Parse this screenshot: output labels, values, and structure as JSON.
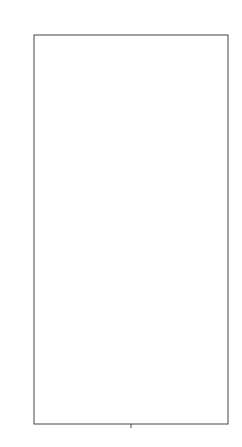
{
  "chart_data": {
    "type": "boxplot",
    "title": "",
    "xlabel": "",
    "ylabel": "",
    "categories": [
      "会员年龄"
    ],
    "ylim": [
      0,
      116
    ],
    "yticks": [
      20,
      40,
      60,
      80,
      100
    ],
    "grid": true,
    "legend": null,
    "series": [
      {
        "name": "会员年龄",
        "q1": 35,
        "median": 41,
        "q3": 48,
        "whisker_low": 16,
        "whisker_high": 67,
        "outliers_high": [
          68,
          69,
          70,
          71,
          72,
          73,
          74,
          75,
          76,
          77,
          78,
          79,
          80,
          81,
          82,
          83,
          84,
          85,
          86,
          87,
          88,
          89,
          90,
          91,
          92,
          110
        ],
        "outliers_low": [
          15,
          14,
          13,
          12,
          11,
          9,
          7,
          6
        ],
        "box_color": "#8c8c8c"
      }
    ]
  },
  "labels": {
    "x_category": "会员年龄",
    "ytick_20": "20",
    "ytick_40": "40",
    "ytick_60": "60",
    "ytick_80": "80",
    "ytick_100": "100"
  }
}
